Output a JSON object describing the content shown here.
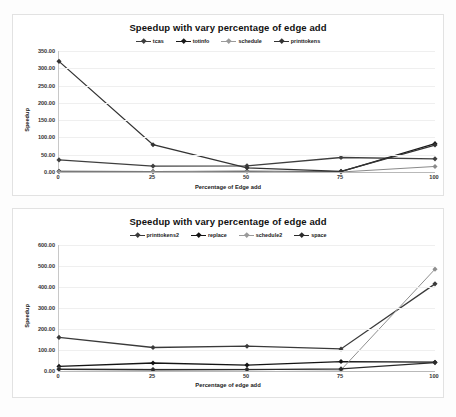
{
  "charts": [
    {
      "id": "chart-1",
      "title": "Speedup with vary percentage of edge add",
      "xlabel": "Percentage of Edge add",
      "ylabel": "Speedup",
      "chart_data": {
        "type": "line",
        "title": "Speedup with vary percentage of edge add",
        "xlabel": "Percentage of Edge add",
        "ylabel": "Speedup",
        "x": [
          0,
          25,
          50,
          75,
          100
        ],
        "xticklabels": [
          "0",
          "25",
          "50",
          "75",
          "100"
        ],
        "yticklabels": [
          "0.00",
          "50.00",
          "100.00",
          "150.00",
          "200.00",
          "250.00",
          "300.00",
          "350.00"
        ],
        "yticks": [
          0,
          50,
          100,
          150,
          200,
          250,
          300,
          350
        ],
        "ylim": [
          0,
          350
        ],
        "grid": true,
        "legend_position": "top-center",
        "series": [
          {
            "name": "tcas",
            "color": "#3f3f3f",
            "values": [
              35,
              17,
              18,
              42,
              38
            ]
          },
          {
            "name": "totinfo",
            "color": "#1a1a1a",
            "values": [
              2,
              1,
              2,
              1,
              82
            ]
          },
          {
            "name": "schedule",
            "color": "#8a8a8a",
            "values": [
              1,
              1,
              2,
              0,
              16
            ]
          },
          {
            "name": "printtokens",
            "color": "#333333",
            "values": [
              320,
              79,
              12,
              2,
              78
            ]
          }
        ]
      }
    },
    {
      "id": "chart-2",
      "title": "Speedup with vary percentage of edge add",
      "xlabel": "Percentage of edge add",
      "ylabel": "Speedup",
      "chart_data": {
        "type": "line",
        "title": "Speedup with vary percentage of edge add",
        "xlabel": "Percentage of edge add",
        "ylabel": "Speedup",
        "x": [
          0,
          25,
          50,
          75,
          100
        ],
        "xticklabels": [
          "0",
          "25",
          "50",
          "75",
          "100"
        ],
        "yticklabels": [
          "0.00",
          "100.00",
          "200.00",
          "300.00",
          "400.00",
          "500.00",
          "600.00"
        ],
        "yticks": [
          0,
          100,
          200,
          300,
          400,
          500,
          600
        ],
        "ylim": [
          0,
          600
        ],
        "grid": true,
        "legend_position": "top-center",
        "series": [
          {
            "name": "printtokens2",
            "color": "#3a3a3a",
            "values": [
              160,
              112,
              118,
              105,
              415
            ]
          },
          {
            "name": "replace",
            "color": "#141414",
            "values": [
              22,
              38,
              28,
              45,
              42
            ]
          },
          {
            "name": "schedule2",
            "color": "#8f8f8f",
            "values": [
              10,
              8,
              8,
              5,
              485
            ]
          },
          {
            "name": "space",
            "color": "#2b2b2b",
            "values": [
              8,
              6,
              7,
              10,
              40
            ]
          }
        ]
      }
    }
  ]
}
